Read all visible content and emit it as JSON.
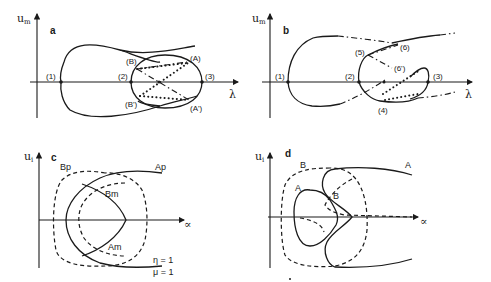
{
  "figure": {
    "panels": [
      {
        "id": "a",
        "label": "a",
        "y_axis_label": "u",
        "y_axis_sub": "m",
        "x_axis_label": "λ",
        "points": [
          "(1)",
          "(2)",
          "(3)",
          "(A)",
          "(B)",
          "(A')",
          "(B')"
        ]
      },
      {
        "id": "b",
        "label": "b",
        "y_axis_label": "u",
        "y_axis_sub": "m",
        "x_axis_label": "λ",
        "points": [
          "(1)",
          "(2)",
          "(3)",
          "(4)",
          "(5)",
          "(6)",
          "(6')"
        ]
      },
      {
        "id": "c",
        "label": "c",
        "y_axis_label": "u",
        "y_axis_sub": "i",
        "x_axis_label": "∝",
        "curves": [
          "Bp",
          "Ap",
          "Bm",
          "Am"
        ],
        "params": [
          "η = 1",
          "μ = 1"
        ]
      },
      {
        "id": "d",
        "label": "d",
        "y_axis_label": "u",
        "y_axis_sub": "i",
        "x_axis_label": "∝",
        "curves": [
          "B",
          "A",
          "A",
          "B"
        ]
      }
    ]
  }
}
